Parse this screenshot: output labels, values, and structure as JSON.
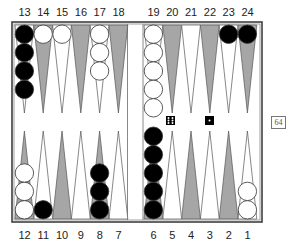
{
  "board": {
    "top_labels": [
      "13",
      "14",
      "15",
      "16",
      "17",
      "18",
      "19",
      "20",
      "21",
      "22",
      "23",
      "24"
    ],
    "bottom_labels": [
      "12",
      "11",
      "10",
      "9",
      "8",
      "7",
      "6",
      "5",
      "4",
      "3",
      "2",
      "1"
    ],
    "colors": {
      "frame": "#333333",
      "dark_point": "#a6a6a6",
      "light_point": "#ffffff",
      "black_checker": "#000000",
      "white_checker": "#ffffff"
    },
    "checkers": [
      {
        "point": 13,
        "color": "black",
        "count": 4
      },
      {
        "point": 14,
        "color": "white",
        "count": 1
      },
      {
        "point": 15,
        "color": "white",
        "count": 1
      },
      {
        "point": 17,
        "color": "white",
        "count": 3
      },
      {
        "point": 19,
        "color": "white",
        "count": 5
      },
      {
        "point": 23,
        "color": "black",
        "count": 1
      },
      {
        "point": 24,
        "color": "black",
        "count": 1
      },
      {
        "point": 12,
        "color": "white",
        "count": 3
      },
      {
        "point": 11,
        "color": "black",
        "count": 1
      },
      {
        "point": 8,
        "color": "black",
        "count": 3
      },
      {
        "point": 6,
        "color": "black",
        "count": 5
      },
      {
        "point": 1,
        "color": "white",
        "count": 2
      }
    ]
  },
  "dice": [
    6,
    1
  ],
  "cube": {
    "value": "64"
  }
}
